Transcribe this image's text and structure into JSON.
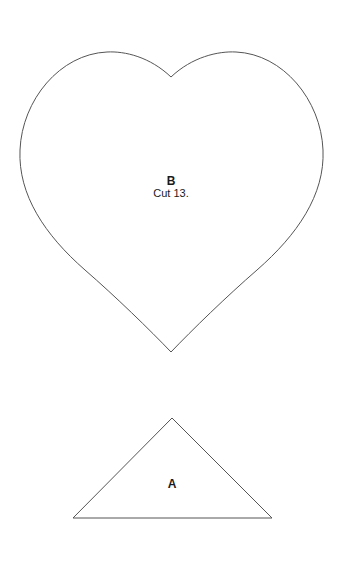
{
  "pieces": [
    {
      "id": "B",
      "shape": "heart",
      "letter": "B",
      "instruction": "Cut 13."
    },
    {
      "id": "A",
      "shape": "triangle",
      "letter": "A"
    }
  ],
  "colors": {
    "outline": "#555555",
    "background": "#ffffff",
    "text": "#1a1a1a"
  }
}
